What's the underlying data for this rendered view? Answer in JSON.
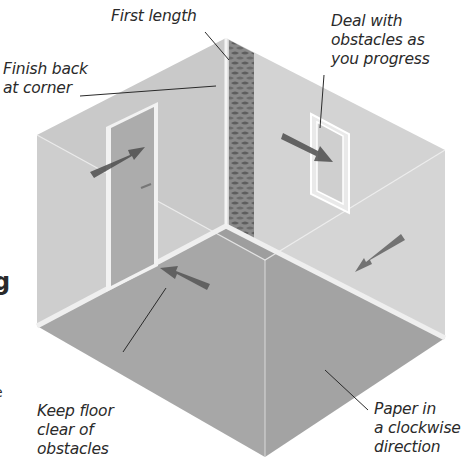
{
  "diagram": {
    "type": "isometric-room-illustration",
    "colors": {
      "background": "#ffffff",
      "back_wall_left": "#c9c9c9",
      "back_wall_right": "#d3d3d3",
      "floor": "#9e9e9e",
      "skirting": "#ececec",
      "door": "#acacac",
      "door_frame": "#f2f2f2",
      "first_length_strip": "#7d7d7d",
      "arrow": "#4d4d4d",
      "leader_line": "#2a2a2a",
      "text": "#2a2a2a"
    },
    "labels": {
      "first_length": "First length",
      "finish_back": "Finish back\nat corner",
      "deal_with_obstacles": "Deal with\nobstacles as\nyou progress",
      "keep_floor_clear": "Keep floor\nclear of\nobstacles",
      "paper_clockwise": "Paper in\na clockwise\ndirection"
    },
    "edge_fragments": {
      "left_cut_glyph_1": "g",
      "left_cut_glyph_2": "e"
    },
    "elements": [
      {
        "name": "first-length-strip",
        "description": "patterned wallpaper strip at back corner"
      },
      {
        "name": "door",
        "description": "doorway on left wall"
      },
      {
        "name": "window",
        "description": "window on right wall"
      },
      {
        "name": "direction-arrows",
        "count": 4,
        "description": "arrows showing clockwise papering direction"
      }
    ]
  }
}
